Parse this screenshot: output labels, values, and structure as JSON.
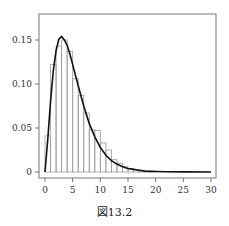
{
  "caption": "図13.2",
  "chart_data": {
    "type": "bar",
    "title": "",
    "xlabel": "",
    "ylabel": "",
    "xlim": [
      0,
      30
    ],
    "ylim": [
      0,
      0.16
    ],
    "grid": false,
    "legend": null,
    "x_ticks": [
      0,
      5,
      10,
      15,
      20,
      25,
      30
    ],
    "x_tick_labels": [
      "0",
      "5",
      "10",
      "15",
      "20",
      "25",
      "30"
    ],
    "y_ticks": [
      0,
      0.05,
      0.1,
      0.15
    ],
    "y_tick_labels": [
      "0",
      "0.05",
      "0.10",
      "0.15"
    ],
    "histogram": {
      "bin_width": 1,
      "bin_edges": [
        0,
        1,
        2,
        3,
        4,
        5,
        6,
        7,
        8,
        9,
        10,
        11,
        12,
        13,
        14,
        15,
        16,
        17,
        18,
        19,
        20
      ],
      "values": [
        0.041,
        0.122,
        0.143,
        0.15,
        0.137,
        0.106,
        0.087,
        0.067,
        0.048,
        0.047,
        0.033,
        0.025,
        0.014,
        0.01,
        0.006,
        0.004,
        0.003,
        0.002,
        0.001,
        0.001
      ]
    },
    "series": [
      {
        "name": "density curve (chi-square, df=5)",
        "type": "line",
        "x": [
          0,
          0.5,
          1,
          1.5,
          2,
          2.5,
          3,
          3.5,
          4,
          4.5,
          5,
          6,
          7,
          8,
          9,
          10,
          11,
          12,
          13,
          14,
          15,
          16,
          17,
          18,
          20,
          22,
          25,
          30
        ],
        "y": [
          0,
          0.037,
          0.08,
          0.115,
          0.138,
          0.151,
          0.154,
          0.15,
          0.144,
          0.134,
          0.122,
          0.098,
          0.075,
          0.055,
          0.04,
          0.028,
          0.019,
          0.013,
          0.009,
          0.006,
          0.004,
          0.003,
          0.002,
          0.001,
          0.0005,
          0.0002,
          0.0001,
          0
        ]
      }
    ],
    "colors": {
      "bars_stroke": "#9a9a9a",
      "curve": "#111111",
      "axis": "#777777"
    }
  }
}
